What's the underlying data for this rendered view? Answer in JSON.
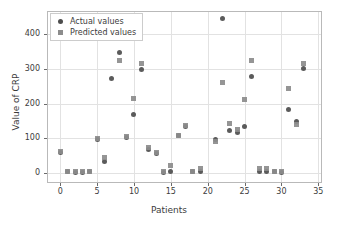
{
  "chart_data": {
    "type": "scatter",
    "title": "",
    "xlabel": "Patients",
    "ylabel": "Value of CRP",
    "xlim": [
      -1.8,
      35.5
    ],
    "ylim": [
      -30,
      468
    ],
    "xticks": [
      0,
      5,
      10,
      15,
      20,
      25,
      30,
      35
    ],
    "yticks": [
      0,
      100,
      200,
      300,
      400
    ],
    "grid": true,
    "legend_position": "upper left",
    "x": [
      0,
      1,
      2,
      3,
      4,
      5,
      6,
      7,
      8,
      9,
      10,
      11,
      12,
      13,
      14,
      15,
      16,
      17,
      18,
      19,
      20,
      21,
      22,
      23,
      24,
      25,
      26,
      27,
      28,
      29,
      30,
      31,
      32,
      33
    ],
    "series": [
      {
        "name": "Actual values",
        "marker": "circle",
        "color": "#4d4d4d",
        "values": [
          57,
          3,
          1,
          1,
          3,
          95,
          31,
          272,
          347,
          102,
          167,
          299,
          68,
          54,
          1,
          3,
          108,
          133,
          3,
          2,
          null,
          97,
          445,
          122,
          115,
          133,
          279,
          2,
          2,
          2,
          1,
          184,
          148,
          301
        ]
      },
      {
        "name": "Predicted values",
        "marker": "square",
        "color": "#8c8c8c",
        "values": [
          62,
          3,
          2,
          2,
          4,
          99,
          45,
          null,
          325,
          104,
          216,
          317,
          73,
          58,
          2,
          20,
          108,
          137,
          4,
          12,
          null,
          91,
          261,
          143,
          126,
          212,
          326,
          12,
          12,
          3,
          3,
          244,
          138,
          317
        ]
      }
    ]
  },
  "legend": {
    "items": [
      {
        "label": "Actual values",
        "marker": "circle-marker"
      },
      {
        "label": "Predicted values",
        "marker": "square-marker"
      }
    ]
  }
}
